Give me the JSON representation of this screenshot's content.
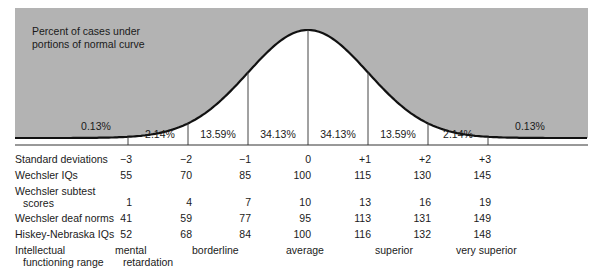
{
  "chart_data": {
    "type": "area",
    "title": "Percent of cases under portions of normal curve",
    "curve": "normal distribution",
    "grid": false,
    "segments_percent": [
      {
        "range": "< -3 SD",
        "value": 0.13,
        "label": "0.13%"
      },
      {
        "range": "-3 to -2 SD",
        "value": 2.14,
        "label": "2.14%"
      },
      {
        "range": "-2 to -1 SD",
        "value": 13.59,
        "label": "13.59%"
      },
      {
        "range": "-1 to 0 SD",
        "value": 34.13,
        "label": "34.13%"
      },
      {
        "range": "0 to +1 SD",
        "value": 34.13,
        "label": "34.13%"
      },
      {
        "range": "+1 to +2 SD",
        "value": 13.59,
        "label": "13.59%"
      },
      {
        "range": "+2 to +3 SD",
        "value": 2.14,
        "label": "2.14%"
      },
      {
        "range": "> +3 SD",
        "value": 0.13,
        "label": "0.13%"
      }
    ],
    "x_ticks": [
      "-3",
      "-2",
      "-1",
      "0",
      "+1",
      "+2",
      "+3"
    ],
    "table": {
      "columns": [
        "-3",
        "-2",
        "-1",
        "0",
        "+1",
        "+2",
        "+3"
      ],
      "rows": [
        {
          "label": "Standard deviations",
          "values": [
            "−3",
            "−2",
            "−1",
            "0",
            "+1",
            "+2",
            "+3"
          ]
        },
        {
          "label": "Wechsler IQs",
          "values": [
            "55",
            "70",
            "85",
            "100",
            "115",
            "130",
            "145"
          ]
        },
        {
          "label": "Wechsler subtest scores",
          "values": [
            "1",
            "4",
            "7",
            "10",
            "13",
            "16",
            "19"
          ]
        },
        {
          "label": "Wechsler deaf norms",
          "values": [
            "41",
            "59",
            "77",
            "95",
            "113",
            "131",
            "149"
          ]
        },
        {
          "label": "Hiskey-Nebraska IQs",
          "values": [
            "52",
            "68",
            "84",
            "100",
            "116",
            "132",
            "148"
          ]
        }
      ],
      "intellectual_functioning_range": [
        "mental retardation",
        "borderline",
        "average",
        "superior",
        "very superior"
      ]
    }
  },
  "caption": {
    "line1": "Percent of cases under",
    "line2": "portions of normal curve"
  },
  "percents": {
    "left_tail": "0.13%",
    "p1": "2.14%",
    "p2": "13.59%",
    "p3": "34.13%",
    "p4": "34.13%",
    "p5": "13.59%",
    "p6": "2.14%",
    "right_tail": "0.13%"
  },
  "rows": {
    "sd": {
      "label": "Standard deviations",
      "v": [
        "−3",
        "−2",
        "−1",
        "0",
        "+1",
        "+2",
        "+3"
      ]
    },
    "wiq": {
      "label": "Wechsler IQs",
      "v": [
        "55",
        "70",
        "85",
        "100",
        "115",
        "130",
        "145"
      ]
    },
    "sub": {
      "label1": "Wechsler subtest",
      "label2": "scores",
      "v": [
        "1",
        "4",
        "7",
        "10",
        "13",
        "16",
        "19"
      ]
    },
    "deaf": {
      "label": "Wechsler deaf norms",
      "v": [
        "41",
        "59",
        "77",
        "95",
        "113",
        "131",
        "149"
      ]
    },
    "hn": {
      "label": "Hiskey-Nebraska IQs",
      "v": [
        "52",
        "68",
        "84",
        "100",
        "116",
        "132",
        "148"
      ]
    },
    "ifr": {
      "label1": "Intellectual",
      "label2": "functioning range",
      "mr1": "mental",
      "mr2": "retardation",
      "borderline": "borderline",
      "average": "average",
      "superior": "superior",
      "very_superior": "very superior"
    }
  },
  "colors": {
    "shade": "#b3b3b3",
    "curve": "#111111",
    "line": "#333333"
  }
}
